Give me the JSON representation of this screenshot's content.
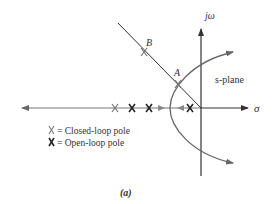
{
  "figure": {
    "caption": "(a)",
    "plane_label": "s-plane",
    "axis_labels": {
      "imaginary": "jω",
      "real": "σ"
    },
    "points": [
      {
        "label": "B",
        "x": 144,
        "y": 52
      },
      {
        "label": "A",
        "x": 178,
        "y": 84
      }
    ],
    "closed_loop_poles_on_axis": [
      115
    ],
    "open_loop_poles_on_axis": [
      132,
      149,
      190
    ],
    "legend": [
      {
        "symbol": "X",
        "type": "closed-loop",
        "text": "= Closed-loop pole"
      },
      {
        "symbol": "X",
        "type": "open-loop",
        "text": "= Open-loop pole"
      }
    ],
    "colors": {
      "axis": "#333333",
      "locus": "#666666",
      "closed_loop_pole": "#777777",
      "open_loop_pole": "#222222",
      "text": "#333333"
    }
  }
}
